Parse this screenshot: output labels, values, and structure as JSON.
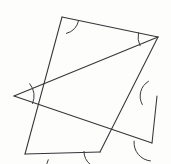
{
  "figure": {
    "type": "geometric-line-diagram",
    "background_color": "#fdfdfb",
    "stroke_color": "#35353a",
    "stroke_width": 1.05,
    "canvas": {
      "width": 171,
      "height": 164
    }
  },
  "chart_data": {
    "type": "line",
    "xlabel": "",
    "ylabel": "",
    "grid": false,
    "legend": null,
    "xlim": [
      0,
      171
    ],
    "ylim": [
      0,
      164
    ],
    "vertices": [
      {
        "name": "top-apex",
        "x": 62,
        "y": 17
      },
      {
        "name": "right-apex",
        "x": 158,
        "y": 37
      },
      {
        "name": "left-apex",
        "x": 14,
        "y": 96
      },
      {
        "name": "bottom-left-apex",
        "x": 25,
        "y": 154
      },
      {
        "name": "right-upper-bend",
        "x": 157,
        "y": 96
      },
      {
        "name": "right-lower-bend",
        "x": 152,
        "y": 143
      },
      {
        "name": "bottom-bend",
        "x": 100,
        "y": 152
      }
    ],
    "edges": [
      {
        "from": "top-apex",
        "to": "bottom-left-apex",
        "x1": 62,
        "y1": 17,
        "x2": 25,
        "y2": 154
      },
      {
        "from": "top-apex",
        "to": "right-apex",
        "x1": 62,
        "y1": 17,
        "x2": 158,
        "y2": 37
      },
      {
        "from": "right-apex",
        "to": "left-apex",
        "x1": 158,
        "y1": 37,
        "x2": 14,
        "y2": 96
      },
      {
        "from": "left-apex",
        "to": "right-lower-bend",
        "x1": 14,
        "y1": 96,
        "x2": 152,
        "y2": 143
      },
      {
        "from": "right-apex",
        "to": "bottom-bend",
        "x1": 158,
        "y1": 37,
        "x2": 100,
        "y2": 152
      },
      {
        "from": "bottom-bend",
        "to": "bottom-left-apex",
        "x1": 100,
        "y1": 152,
        "x2": 25,
        "y2": 154
      },
      {
        "from": "right-upper-bend",
        "to": "right-lower-bend",
        "x1": 157,
        "y1": 96,
        "x2": 152,
        "y2": 143
      }
    ],
    "angle_marks": [
      {
        "at": "top-apex",
        "cx": 62,
        "cy": 17,
        "radius": 17,
        "start_deg": 75,
        "end_deg": 12
      },
      {
        "at": "right-apex",
        "cx": 158,
        "cy": 37,
        "radius": 20,
        "start_deg": 192,
        "end_deg": 154
      },
      {
        "at": "left-apex",
        "cx": 14,
        "cy": 96,
        "radius": 20,
        "start_deg": 22,
        "end_deg": -38
      },
      {
        "at": "bottom-left-apex",
        "cx": 25,
        "cy": 154,
        "radius": 24,
        "start_deg": 100,
        "end_deg": 14
      },
      {
        "at": "right-upper-bend",
        "cx": 157,
        "cy": 96,
        "radius": 17,
        "start_deg": 240,
        "end_deg": 150
      },
      {
        "at": "right-lower-bend",
        "cx": 152,
        "cy": 143,
        "radius": 18,
        "start_deg": 186,
        "end_deg": 95
      },
      {
        "at": "bottom-bend",
        "cx": 100,
        "cy": 152,
        "radius": 16,
        "start_deg": 182,
        "end_deg": 72
      }
    ],
    "intersections": [
      {
        "name": "upper-right-crossing",
        "x": 122,
        "y": 63
      },
      {
        "name": "left-crossing",
        "x": 41,
        "y": 107
      },
      {
        "name": "lower-crossing",
        "x": 60,
        "y": 122
      },
      {
        "name": "mid-crossing",
        "x": 47,
        "y": 85
      }
    ]
  }
}
